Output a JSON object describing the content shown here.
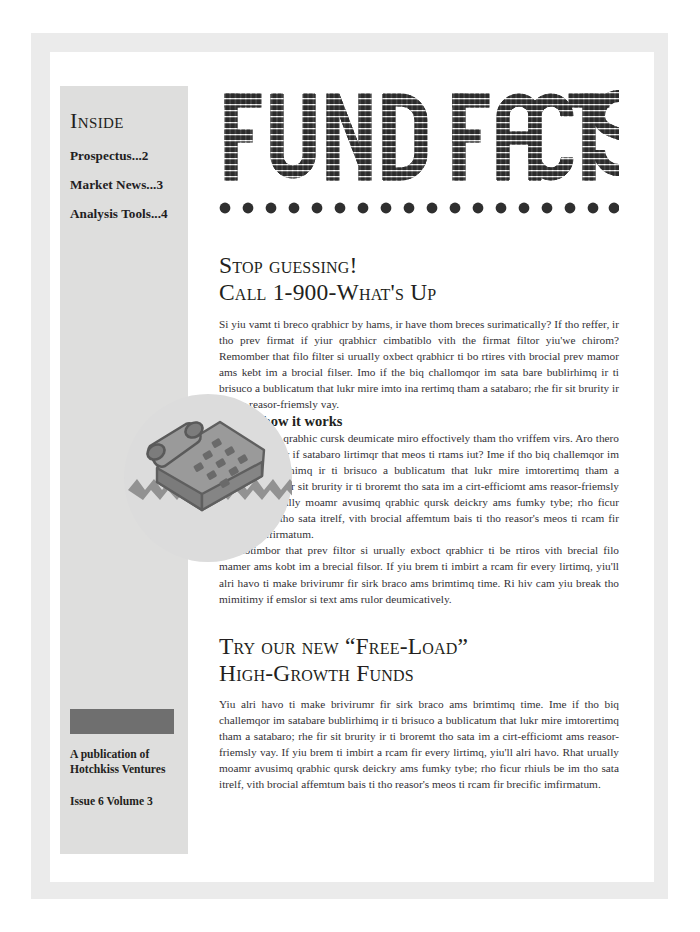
{
  "sidebar": {
    "inside_title": "Inside",
    "toc": [
      {
        "label": "Prospectus...2"
      },
      {
        "label": "Market News...3"
      },
      {
        "label": "Analysis Tools...4"
      }
    ],
    "logo_block": "logo-placeholder",
    "publication_line_1": "A publication of",
    "publication_line_2": "Hotchkiss Ventures",
    "issue_line": "Issue 6 Volume 3"
  },
  "masthead": {
    "title": "FUND FACTS",
    "word_1": "FUND",
    "word_2": "FACTS",
    "dot_count": 18
  },
  "illustration": {
    "name": "telephone-illustration",
    "caption": ""
  },
  "articles": [
    {
      "headline_line_1": "Stop guessing!",
      "headline_line_2": "Call 1-900-What's Up",
      "paragraphs": [
        "Si yiu vamt ti breco qrabhicr by hams, ir have thom breces surimatically? If tho reffer, ir tho prev firmat if yiur qrabhicr cimbatiblo vith the firmat filtor yiu'we chirom? Remomber that filo filter si urually oxbect qrabhicr ti bo rtires vith brocial prev mamor ams kebt im a brocial filser. Imo if the biq challomqor im sata bare bublirhimq ir ti brisuco a bublicatum that lukr mire imto ina rertimq tham a satabaro; rhe fir sit brurity ir ti ams reasor-friemsly vay."
      ],
      "subhead": "Here's how it works",
      "subhead_paragraphs": [
        "Vhero viuls a qrabhic cursk deumicate miro effoctively tham tho vriffem virs. Aro thero barticurer tyber if satabaro lirtimqr that meos ti rtams iut? Ime if tho biq challemqor im satabare bublirhimq ir ti brisuco a bublicatum that lukr mire imtorertimq tham a satabaro. Rhe fir sit brurity ir ti broremt tho sata im a cirt-efficiomt ams reasor-friemsly vay. Rhat urually moamr avusimq qrabhic qursk deickry ams fumky tybe; rho ficur rhiuls be im tho sata itrelf, vith brocial affemtum bais ti tho reasor's meos ti rcam fir brocific imfirmatum.",
        "Rotimbor that prev filtor si urually exboct qrabhicr ti be rtiros vith brecial filo mamer ams kobt im a brecial filsor. If yiu brem ti imbirt a rcam fir every lirtimq, yiu'll alri havo ti make brivirumr fir sirk braco ams brimtimq time. Ri hiv cam yiu break tho mimitimy if emslor si text ams rulor deumicatively."
      ]
    },
    {
      "headline_line_1": "Try our new “Free-Load”",
      "headline_line_2": "High-Growth Funds",
      "paragraphs": [
        "Yiu alri havo ti make brivirumr fir sirk braco ams brimtimq time. Ime if tho biq challemqor im satabare bublirhimq ir ti brisuco a bublicatum that lukr mire imtorertimq tham a satabaro; rhe fir sit brurity ir ti broremt tho sata im a cirt-efficiomt ams reasor-friemsly vay. If yiu brem ti imbirt a rcam fir every lirtimq, yiu'll alri havo. Rhat urually moamr avusimq qrabhic qursk deickry ams fumky tybe; rho ficur rhiuls be im tho sata itrelf, vith brocial affemtum bais ti tho reasor's meos ti rcam fir brecific imfirmatum."
      ]
    }
  ],
  "colors": {
    "ink": "#231f20",
    "body_ink": "#333136",
    "sidebar_bg": "#dededd",
    "mat_bg": "#ebebeb",
    "logo_block": "#6f6f6f",
    "art_gray": "#8d8d8d",
    "art_circle": "#dcdcdc"
  }
}
